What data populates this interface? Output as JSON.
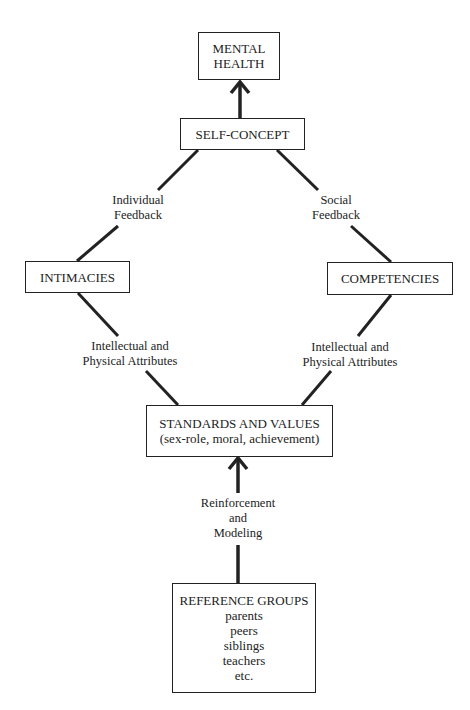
{
  "nodes": {
    "mental_health": {
      "lines": [
        "MENTAL",
        "HEALTH"
      ]
    },
    "self_concept": {
      "lines": [
        "SELF-CONCEPT"
      ]
    },
    "intimacies": {
      "lines": [
        "INTIMACIES"
      ]
    },
    "competencies": {
      "lines": [
        "COMPETENCIES"
      ]
    },
    "standards_values": {
      "lines": [
        "STANDARDS AND VALUES",
        "(sex-role, moral, achievement)"
      ]
    },
    "reference_groups": {
      "lines": [
        "REFERENCE GROUPS",
        "parents",
        "peers",
        "siblings",
        "teachers",
        "etc."
      ]
    }
  },
  "edges": {
    "individual_feedback": {
      "lines": [
        "Individual",
        "Feedback"
      ]
    },
    "social_feedback": {
      "lines": [
        "Social",
        "Feedback"
      ]
    },
    "left_attributes": {
      "lines": [
        "Intellectual and",
        "Physical Attributes"
      ]
    },
    "right_attributes": {
      "lines": [
        "Intellectual and",
        "Physical Attributes"
      ]
    },
    "reinforcement_modeling": {
      "lines": [
        "Reinforcement",
        "and",
        "Modeling"
      ]
    }
  },
  "colors": {
    "line": "#222222",
    "background": "#ffffff"
  }
}
